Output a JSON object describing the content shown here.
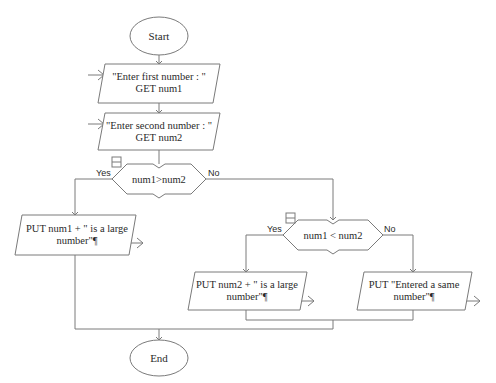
{
  "diagram": {
    "type": "flowchart",
    "colors": {
      "stroke": "#7a7a7a",
      "text": "#2a2a2a",
      "background": "#ffffff"
    },
    "clipped_top_text": "· · · · · · · · · · · · ·",
    "nodes": {
      "start": {
        "shape": "terminator",
        "label": "Start"
      },
      "input1": {
        "shape": "io",
        "line1": "\"Enter first number : \"",
        "line2": "GET num1"
      },
      "input2": {
        "shape": "io",
        "line1": "\"Enter second number : \"",
        "line2": "GET num2"
      },
      "decision1": {
        "shape": "decision",
        "label": "num1>num2",
        "yes": "Yes",
        "no": "No"
      },
      "output1": {
        "shape": "io",
        "line1": "PUT num1  +  \" is a large",
        "line2": "number\"¶"
      },
      "decision2": {
        "shape": "decision",
        "label": "num1 < num2",
        "yes": "Yes",
        "no": "No"
      },
      "output2": {
        "shape": "io",
        "line1": "PUT num2  +  \" is a large",
        "line2": "number\"¶"
      },
      "output3": {
        "shape": "io",
        "line1": "PUT \"Entered a same",
        "line2": "number\"¶"
      },
      "end": {
        "shape": "terminator",
        "label": "End"
      }
    },
    "edges": [
      {
        "from": "start",
        "to": "input1"
      },
      {
        "from": "input1",
        "to": "input2"
      },
      {
        "from": "input2",
        "to": "decision1"
      },
      {
        "from": "decision1",
        "to": "output1",
        "label": "Yes"
      },
      {
        "from": "decision1",
        "to": "decision2",
        "label": "No"
      },
      {
        "from": "decision2",
        "to": "output2",
        "label": "Yes"
      },
      {
        "from": "decision2",
        "to": "output3",
        "label": "No"
      },
      {
        "from": "output2",
        "to": "end"
      },
      {
        "from": "output3",
        "to": "end"
      },
      {
        "from": "output1",
        "to": "end"
      }
    ]
  }
}
